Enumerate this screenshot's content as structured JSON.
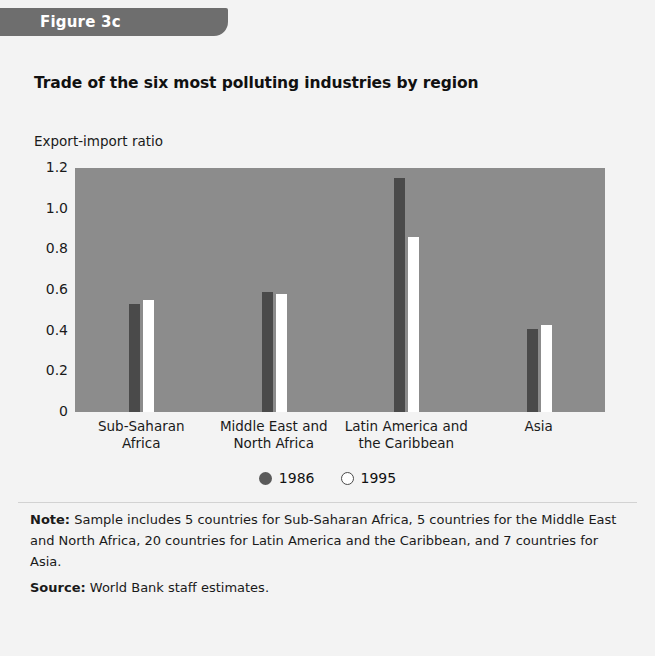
{
  "figure": {
    "tab_label": "Figure 3c",
    "tab_color": "#6e6e6e",
    "background_color": "#f3f3f3"
  },
  "title": "Trade of the six most polluting industries by region",
  "footnotes": {
    "note_label": "Note:",
    "note_text": " Sample includes 5 countries for Sub-Saharan Africa, 5 countries for the Middle East and North Africa, 20 countries for Latin America and the Caribbean, and 7 countries for Asia.",
    "source_label": "Source:",
    "source_text": " World Bank staff estimates."
  },
  "legend": {
    "position": "bottom-center",
    "entries": [
      {
        "label": "1986",
        "swatch": "filled-circle-icon",
        "color": "#4a4a4a"
      },
      {
        "label": "1995",
        "swatch": "open-circle-icon",
        "color": "#ffffff"
      }
    ]
  },
  "chart_data": {
    "type": "bar",
    "title": "Trade of the six most polluting industries by region",
    "xlabel": "",
    "ylabel": "Export-import ratio",
    "categories": [
      "Sub-Saharan\nAfrica",
      "Middle East and\nNorth Africa",
      "Latin America and\nthe Caribbean",
      "Asia"
    ],
    "category_lines": [
      [
        "Sub-Saharan",
        "Africa"
      ],
      [
        "Middle East and",
        "North Africa"
      ],
      [
        "Latin America and",
        "the Caribbean"
      ],
      [
        "Asia",
        ""
      ]
    ],
    "series": [
      {
        "name": "1986",
        "color": "#4a4a4a",
        "values": [
          0.53,
          0.59,
          1.15,
          0.41
        ]
      },
      {
        "name": "1995",
        "color": "#ffffff",
        "values": [
          0.55,
          0.58,
          0.86,
          0.43
        ]
      }
    ],
    "ylim": [
      0,
      1.2
    ],
    "yticks": [
      1.2,
      1.0,
      0.8,
      0.6,
      0.4,
      0.2,
      0
    ],
    "ytick_labels": [
      "1.2",
      "1.0",
      "0.8",
      "0.6",
      "0.4",
      "0.2",
      "0"
    ],
    "grid": false,
    "plot_background": "#8c8c8c",
    "legend": [
      "1986",
      "1995"
    ]
  }
}
